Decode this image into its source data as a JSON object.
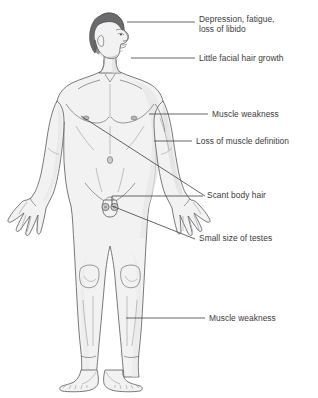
{
  "diagram": {
    "background_color": "#ffffff",
    "text_color": "#3a3a3a",
    "line_color": "#4a4a4c",
    "skin_color": "#f2f2f2",
    "hair_color": "#6b6b6d"
  },
  "labels": [
    {
      "id": "depression",
      "text_line1": "Depression, fatigue,",
      "text_line2": "loss of libido",
      "target": "head-forehead",
      "text_x": 199,
      "text_y": 14,
      "leader": {
        "x1": 127,
        "y1": 22,
        "x2": 195,
        "y2": 22
      }
    },
    {
      "id": "facial-hair",
      "text_line1": "Little facial hair growth",
      "text_line2": "",
      "target": "head-jaw",
      "text_x": 199,
      "text_y": 53,
      "leader": {
        "x1": 131,
        "y1": 58,
        "x2": 195,
        "y2": 58
      }
    },
    {
      "id": "muscle-weakness-arm",
      "text_line1": "Muscle weakness",
      "text_line2": "",
      "target": "upper-arm",
      "text_x": 212,
      "text_y": 109,
      "leader": {
        "x1": 149,
        "y1": 114,
        "x2": 208,
        "y2": 114
      }
    },
    {
      "id": "muscle-definition",
      "text_line1": "Loss of muscle definition",
      "text_line2": "",
      "target": "upper-arm-lower",
      "text_x": 196,
      "text_y": 136,
      "leader": {
        "x1": 154,
        "y1": 141,
        "x2": 192,
        "y2": 141
      }
    },
    {
      "id": "scant-body-hair",
      "text_line1": "Scant body hair",
      "text_line2": "",
      "target": "chest-axilla",
      "text_x": 207,
      "text_y": 190,
      "leader_path": "M 81,116 L 205,196",
      "leader2": {
        "x1": 113,
        "y1": 196,
        "x2": 203,
        "y2": 196
      }
    },
    {
      "id": "small-testes",
      "text_line1": "Small size of testes",
      "text_line2": "",
      "target": "testes",
      "text_x": 199,
      "text_y": 233,
      "leader_path": "M 110,206 L 195,239",
      "leader2": {
        "x1": 113,
        "y1": 206,
        "x2": 113,
        "y2": 196
      }
    },
    {
      "id": "muscle-weakness-leg",
      "text_line1": "Muscle weakness",
      "text_line2": "",
      "target": "calf",
      "text_x": 209,
      "text_y": 313,
      "leader": {
        "x1": 126,
        "y1": 318,
        "x2": 205,
        "y2": 318
      }
    }
  ],
  "body_parts": [
    {
      "name": "head",
      "note": "profile facing right, dark hair"
    },
    {
      "name": "neck"
    },
    {
      "name": "torso",
      "note": "nipples, navel, clavicles visible"
    },
    {
      "name": "left-arm",
      "note": "figure's right, viewer left, hand open fingers spread"
    },
    {
      "name": "right-arm",
      "note": "figure's left, viewer right, hand open fingers spread"
    },
    {
      "name": "legs",
      "note": "knees defined"
    },
    {
      "name": "feet",
      "note": "toes visible"
    },
    {
      "name": "testes",
      "note": "two small circles, reduced size"
    }
  ]
}
